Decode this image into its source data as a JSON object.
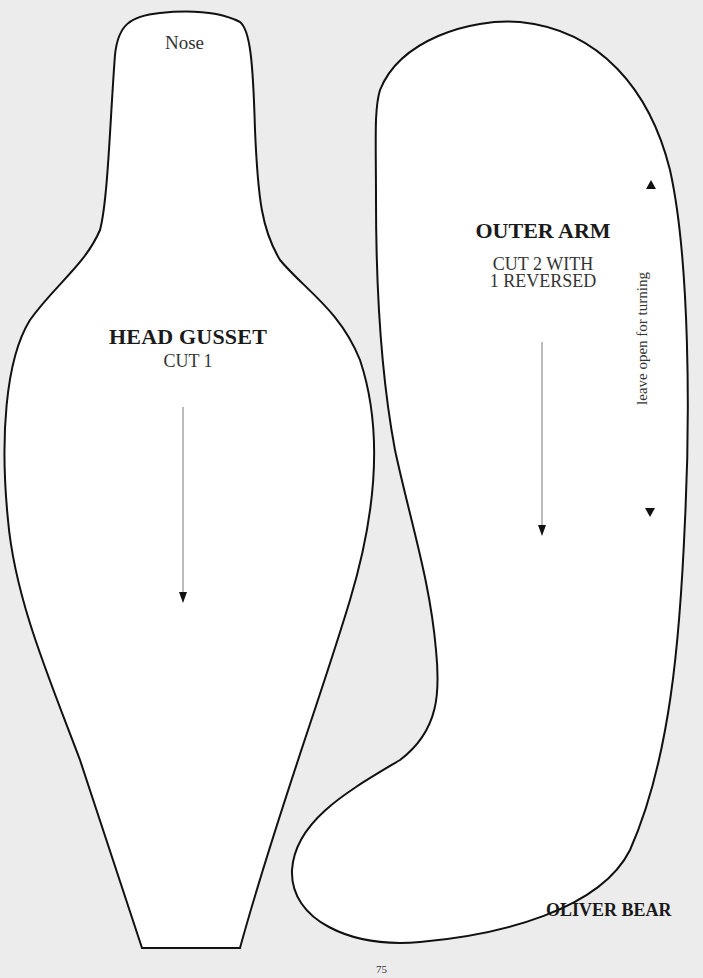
{
  "page": {
    "background_color": "#ececec",
    "piece_fill": "#ffffff",
    "outline_color": "#111111",
    "page_number": "75",
    "footer_title": "OLIVER BEAR"
  },
  "head_gusset": {
    "nose_label": "Nose",
    "title": "HEAD GUSSET",
    "cut_instruction": "CUT 1",
    "grain_arrow": "arrow-down-icon"
  },
  "outer_arm": {
    "title": "OUTER ARM",
    "cut_line1": "CUT 2 WITH",
    "cut_line2": "1 REVERSED",
    "opening_note": "leave open for turning",
    "grain_arrow": "arrow-down-icon",
    "opening_start_marker": "triangle-up-icon",
    "opening_end_marker": "triangle-down-icon"
  }
}
